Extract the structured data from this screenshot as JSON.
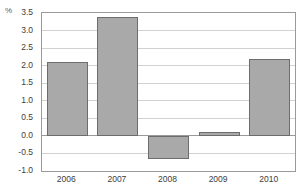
{
  "chart_data": {
    "type": "bar",
    "title": "",
    "xlabel": "",
    "ylabel": "%",
    "unit_label": "%",
    "categories": [
      "2006",
      "2007",
      "2008",
      "2009",
      "2010"
    ],
    "values": [
      2.1,
      3.4,
      -0.65,
      0.1,
      2.2
    ],
    "ylim": [
      -1.0,
      3.5
    ],
    "yticks": [
      "3.5",
      "3.0",
      "2.5",
      "2.0",
      "1.5",
      "1.0",
      "0.5",
      "0.0",
      "-0.5",
      "-1.0"
    ],
    "ytick_values": [
      3.5,
      3.0,
      2.5,
      2.0,
      1.5,
      1.0,
      0.5,
      0.0,
      -0.5,
      -1.0
    ],
    "grid": true,
    "legend": "none",
    "series": [
      {
        "name": "",
        "values": [
          2.1,
          3.4,
          -0.65,
          0.1,
          2.2
        ]
      }
    ],
    "colors": {
      "bar_fill": "#a9a9a9",
      "bar_border": "#6d6d6d",
      "gridline": "#d2d2d2",
      "frame": "#9a9a9a",
      "background": "#ffffff",
      "tick_text": "#3d3d3d"
    }
  }
}
